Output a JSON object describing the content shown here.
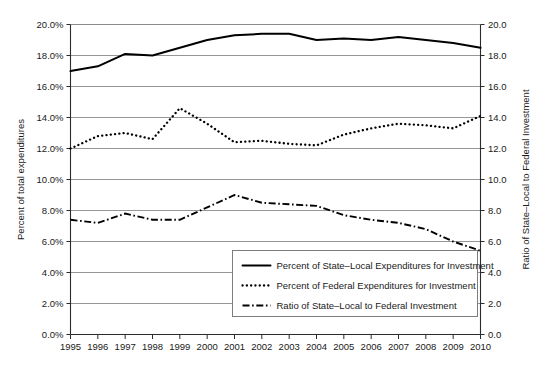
{
  "chart_data": {
    "type": "line",
    "title": "",
    "xlabel": "",
    "ylabel": "Percent of total expenditures",
    "y2label": "Ratio of State–Local to Federal Investment",
    "x": [
      1995,
      1996,
      1997,
      1998,
      1999,
      2000,
      2001,
      2002,
      2003,
      2004,
      2005,
      2006,
      2007,
      2008,
      2009,
      2010
    ],
    "categories": [
      "1995",
      "1996",
      "1997",
      "1998",
      "1999",
      "2000",
      "2001",
      "2002",
      "2003",
      "2004",
      "2005",
      "2006",
      "2007",
      "2008",
      "2009",
      "2010"
    ],
    "ylim": [
      0.0,
      20.0
    ],
    "ylim2": [
      0.0,
      20.0
    ],
    "yticks": [
      "0.0%",
      "2.0%",
      "4.0%",
      "6.0%",
      "8.0%",
      "10.0%",
      "12.0%",
      "14.0%",
      "16.0%",
      "18.0%",
      "20.0%"
    ],
    "ytick_values": [
      0,
      2,
      4,
      6,
      8,
      10,
      12,
      14,
      16,
      18,
      20
    ],
    "y2ticks": [
      "0.0",
      "2.0",
      "4.0",
      "6.0",
      "8.0",
      "10.0",
      "12.0",
      "14.0",
      "16.0",
      "18.0",
      "20.0"
    ],
    "y2tick_values": [
      0,
      2,
      4,
      6,
      8,
      10,
      12,
      14,
      16,
      18,
      20
    ],
    "grid": true,
    "legend_position": "lower-right",
    "series": [
      {
        "name": "Percent of State–Local Expenditures for Investment",
        "style": "solid",
        "axis": "left",
        "values": [
          17.0,
          17.3,
          18.1,
          18.0,
          18.5,
          19.0,
          19.3,
          19.4,
          19.4,
          19.0,
          19.1,
          19.0,
          19.2,
          19.0,
          18.8,
          18.5
        ]
      },
      {
        "name": "Percent of Federal Expenditures for Investment",
        "style": "dotted",
        "axis": "left",
        "values": [
          12.0,
          12.8,
          13.0,
          12.6,
          14.6,
          13.6,
          12.4,
          12.5,
          12.3,
          12.2,
          12.9,
          13.3,
          13.6,
          13.5,
          13.3,
          14.1
        ]
      },
      {
        "name": "Ratio of State–Local to Federal Investment",
        "style": "dash-dot",
        "axis": "right",
        "values": [
          7.4,
          7.2,
          7.8,
          7.4,
          7.4,
          8.2,
          9.0,
          8.5,
          8.4,
          8.3,
          7.7,
          7.4,
          7.2,
          6.8,
          6.0,
          5.4
        ]
      }
    ]
  },
  "legend": {
    "items": [
      {
        "label": "Percent of State–Local Expenditures for Investment",
        "style": "solid"
      },
      {
        "label": "Percent of Federal Expenditures for Investment",
        "style": "dotted"
      },
      {
        "label": "Ratio of State–Local to Federal Investment",
        "style": "dash-dot"
      }
    ]
  },
  "colors": {
    "series": "#000000",
    "gridline": "#8a8a8a",
    "axis": "#2b2b2b",
    "background": "#ffffff",
    "text": "#1a1a1a"
  }
}
